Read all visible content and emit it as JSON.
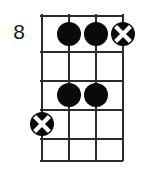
{
  "diagram": {
    "type": "guitar-chord-diagram",
    "fret_number_label": "8",
    "strings": 4,
    "frets": 5,
    "colors": {
      "line": "#2b2b2b",
      "dot": "#0a0a0a",
      "background": "#ffffff",
      "text": "#1a1a1a"
    },
    "string_positions_px": [
      1,
      28,
      55,
      82
    ],
    "fret_positions_px": [
      1,
      37,
      66,
      95,
      124,
      146
    ],
    "markers": [
      {
        "name": "dot-string2-fret1",
        "kind": "dot",
        "string": 2,
        "fret": 1,
        "x": 28,
        "y": 19
      },
      {
        "name": "dot-string3-fret1",
        "kind": "dot",
        "string": 3,
        "fret": 1,
        "x": 55,
        "y": 19
      },
      {
        "name": "x-string4-fret1",
        "kind": "x",
        "string": 4,
        "fret": 1,
        "x": 82,
        "y": 19
      },
      {
        "name": "dot-string2-fret3",
        "kind": "dot",
        "string": 2,
        "fret": 3,
        "x": 28,
        "y": 80
      },
      {
        "name": "dot-string3-fret3",
        "kind": "dot",
        "string": 3,
        "fret": 3,
        "x": 55,
        "y": 80
      },
      {
        "name": "x-string1-fret4",
        "kind": "x",
        "string": 1,
        "fret": 4,
        "x": 1,
        "y": 109
      }
    ]
  }
}
